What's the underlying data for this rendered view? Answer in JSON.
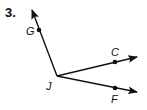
{
  "problem": {
    "number": "3."
  },
  "diagram": {
    "vertex": {
      "label": "J",
      "x": 57,
      "y": 76
    },
    "rays": [
      {
        "name": "JG",
        "point_label": "G",
        "tip": [
          32,
          9
        ],
        "point": [
          39,
          30
        ]
      },
      {
        "name": "JC",
        "point_label": "C",
        "tip": [
          138,
          57
        ],
        "point": [
          115,
          62
        ]
      },
      {
        "name": "JF",
        "point_label": "F",
        "tip": [
          138,
          92
        ],
        "point": [
          115,
          89
        ]
      }
    ],
    "colors": {
      "stroke": "#111111",
      "background": "#ffffff"
    }
  }
}
